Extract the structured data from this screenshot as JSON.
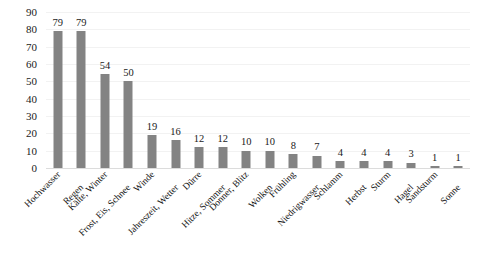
{
  "chart_data": {
    "type": "bar",
    "title": "",
    "subtitle": "",
    "xlabel": "",
    "ylabel": "",
    "ylim": [
      0,
      90
    ],
    "ytick_step": 10,
    "yticks": [
      90,
      80,
      70,
      60,
      50,
      40,
      30,
      20,
      10,
      0
    ],
    "grid": true,
    "legend": false,
    "legend_position": "none",
    "bar_color": "#838383",
    "categories": [
      "Hochwasser",
      "Regen",
      "Kälte, Winter",
      "Frost, Eis, Schnee",
      "Winde",
      "Jahreszeit, Wetter",
      "Dürre",
      "Hitze, Sommer",
      "Donner, Blitz",
      "Wolken",
      "Frühling",
      "Niedrigwasser",
      "Schlamm",
      "Herbst",
      "Sturm",
      "Hagel",
      "Sandsturm",
      "Sonne"
    ],
    "values": [
      79,
      79,
      54,
      50,
      19,
      16,
      12,
      12,
      10,
      10,
      8,
      7,
      4,
      4,
      4,
      3,
      1,
      1
    ],
    "data_labels": [
      "79",
      "79",
      "54",
      "50",
      "19",
      "16",
      "12",
      "12",
      "10",
      "10",
      "8",
      "7",
      "4",
      "4",
      "4",
      "3",
      "1",
      "1"
    ],
    "label_rotation": -45
  }
}
